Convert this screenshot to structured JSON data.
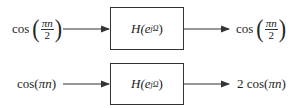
{
  "rows": [
    {
      "input": {
        "func": "cos",
        "numerator": "πn",
        "denominator": "2"
      },
      "system": {
        "H": "H(e",
        "exp": "jΩ",
        "close": ")"
      },
      "output": {
        "func": "cos",
        "numerator": "πn",
        "denominator": "2"
      }
    },
    {
      "input": {
        "text_pre": "cos(",
        "arg": "πn",
        "text_post": ")"
      },
      "system": {
        "H": "H(e",
        "exp": "jΩ",
        "close": ")"
      },
      "output": {
        "text_pre": "2 cos(",
        "arg": "πn",
        "text_post": ")"
      }
    }
  ],
  "colors": {
    "stroke": "#333333",
    "text": "#222222"
  }
}
